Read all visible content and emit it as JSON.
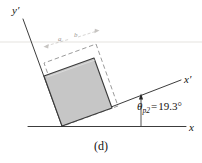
{
  "figure": {
    "caption": "(d)",
    "type": "mohr-circle-principal-element-orientation",
    "axes": {
      "x_label": "x",
      "y_label": "y",
      "x_prime_label": "x′",
      "y_prime_label": "y′"
    },
    "angle": {
      "symbol": "θ",
      "subscript": "p2",
      "equals": "=",
      "value": "19.3",
      "unit": "°",
      "full_text": "θp2 = 19.3°"
    },
    "annotations": {
      "dim_a": "a",
      "dim_b": "b"
    },
    "colors": {
      "element_fill": "#c6c6c6",
      "element_stroke": "#3a3a3a",
      "axis_stroke": "#262626",
      "dashed_stroke": "#8f8f8f",
      "faint_text": "#9b9691",
      "text": "#15120f",
      "background": "#ffffff"
    },
    "geometry": {
      "origin": [
        62,
        126
      ],
      "x_axis_end": [
        186,
        126
      ],
      "x_prime_end": [
        182,
        79
      ],
      "y_prime_end": [
        22,
        18
      ],
      "rotation_deg": 19.3,
      "element_corners": [
        [
          62,
          126
        ],
        [
          112,
          108
        ],
        [
          94,
          58
        ],
        [
          44,
          76
        ]
      ],
      "dashed_corners": [
        [
          66,
          125
        ],
        [
          118,
          106
        ],
        [
          96,
          44
        ],
        [
          44,
          63
        ]
      ]
    }
  }
}
